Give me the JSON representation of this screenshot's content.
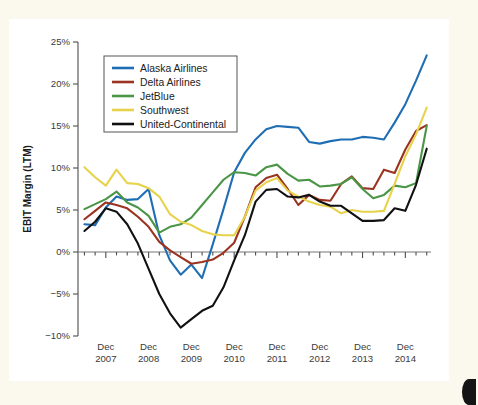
{
  "figure": {
    "background_color": "#fbf8ee",
    "card_color": "#ffffff",
    "corner_mark": "page-edge-mark"
  },
  "chart_data": {
    "type": "line",
    "title": "",
    "xlabel": "",
    "ylabel": "EBIT Margin (LTM)",
    "ylim": [
      -10,
      25
    ],
    "ytick_labels": [
      "25%",
      "20%",
      "15%",
      "10%",
      "5%",
      "0%",
      "−5%",
      "−10%"
    ],
    "ytick_values": [
      25,
      20,
      15,
      10,
      5,
      0,
      -5,
      -10
    ],
    "xtick_labels": [
      [
        "Dec",
        "2007"
      ],
      [
        "Dec",
        "2008"
      ],
      [
        "Dec",
        "2009"
      ],
      [
        "Dec",
        "2010"
      ],
      [
        "Dec",
        "2011"
      ],
      [
        "Dec",
        "2012"
      ],
      [
        "Dec",
        "2013"
      ],
      [
        "Dec",
        "2014"
      ]
    ],
    "xtick_values": [
      2007.95,
      2008.95,
      2009.95,
      2010.95,
      2011.95,
      2012.95,
      2013.95,
      2014.95
    ],
    "xlim": [
      2007.3,
      2015.55
    ],
    "minor_ticks_per_interval": 4,
    "grid": false,
    "legend_position": "top-left",
    "x": [
      2007.45,
      2007.7,
      2007.95,
      2008.2,
      2008.45,
      2008.7,
      2008.95,
      2009.2,
      2009.45,
      2009.7,
      2009.95,
      2010.2,
      2010.45,
      2010.7,
      2010.95,
      2011.2,
      2011.45,
      2011.7,
      2011.95,
      2012.2,
      2012.45,
      2012.7,
      2012.95,
      2013.2,
      2013.45,
      2013.7,
      2013.95,
      2014.2,
      2014.45,
      2014.7,
      2014.95,
      2015.2,
      2015.45
    ],
    "series": [
      {
        "name": "Alaska Airlines",
        "color": "#1f6eb4",
        "values": [
          3.3,
          3.2,
          5.3,
          6.6,
          6.2,
          6.3,
          7.5,
          2.0,
          -1.0,
          -2.7,
          -1.5,
          -3.1,
          0.9,
          5.1,
          9.5,
          11.8,
          13.4,
          14.6,
          15.0,
          14.9,
          14.8,
          13.1,
          12.9,
          13.2,
          13.4,
          13.4,
          13.7,
          13.6,
          13.4,
          15.4,
          17.6,
          20.4,
          23.4
        ]
      },
      {
        "name": "Delta Airlines",
        "color": "#9a3420",
        "values": [
          3.9,
          4.9,
          5.9,
          5.6,
          5.2,
          4.2,
          3.0,
          1.2,
          0.2,
          -0.6,
          -1.4,
          -1.2,
          -0.9,
          -0.1,
          1.1,
          4.2,
          7.7,
          8.8,
          9.2,
          7.5,
          5.6,
          6.8,
          6.2,
          6.1,
          8.1,
          9.0,
          7.6,
          7.5,
          9.8,
          9.4,
          12.2,
          14.4,
          15.1
        ]
      },
      {
        "name": "JetBlue",
        "color": "#4a9646",
        "values": [
          5.1,
          5.7,
          6.3,
          7.2,
          5.9,
          5.3,
          4.3,
          2.3,
          3.0,
          3.3,
          4.1,
          5.6,
          7.1,
          8.6,
          9.5,
          9.4,
          9.1,
          10.1,
          10.4,
          9.3,
          8.5,
          8.6,
          7.8,
          7.9,
          8.1,
          8.9,
          7.5,
          6.4,
          6.8,
          7.9,
          7.7,
          8.2,
          15.0
        ]
      },
      {
        "name": "Southwest",
        "color": "#e7d24c",
        "values": [
          10.1,
          8.9,
          7.9,
          9.8,
          8.2,
          8.1,
          7.6,
          6.6,
          4.5,
          3.6,
          3.2,
          2.5,
          2.1,
          2.0,
          2.0,
          4.2,
          7.3,
          8.3,
          8.8,
          7.3,
          6.6,
          6.0,
          5.6,
          5.4,
          4.6,
          5.0,
          4.8,
          4.8,
          4.9,
          8.1,
          11.4,
          14.0,
          17.2
        ]
      },
      {
        "name": "United-Continental",
        "color": "#111111",
        "values": [
          2.5,
          3.6,
          5.2,
          4.8,
          3.3,
          1.0,
          -2.0,
          -5.0,
          -7.3,
          -9.0,
          -8.0,
          -7.0,
          -6.4,
          -4.2,
          -1.0,
          2.0,
          6.0,
          7.4,
          7.5,
          6.6,
          6.5,
          6.8,
          6.0,
          5.5,
          5.5,
          4.6,
          3.7,
          3.7,
          3.8,
          5.2,
          4.9,
          8.0,
          12.3
        ]
      }
    ]
  }
}
